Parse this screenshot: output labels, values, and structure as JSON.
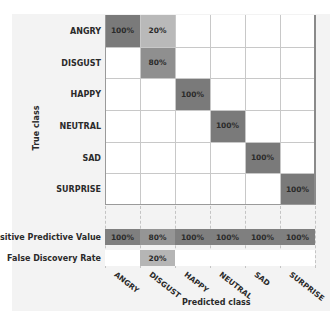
{
  "chart_data": {
    "type": "heatmap",
    "title": "",
    "xlabel": "Predicted class",
    "ylabel": "True class",
    "classes": [
      "ANGRY",
      "DISGUST",
      "HAPPY",
      "NEUTRAL",
      "SAD",
      "SURPRISE"
    ],
    "matrix": [
      [
        "100%",
        "20%",
        "",
        "",
        "",
        ""
      ],
      [
        "",
        "80%",
        "",
        "",
        "",
        ""
      ],
      [
        "",
        "",
        "100%",
        "",
        "",
        ""
      ],
      [
        "",
        "",
        "",
        "100%",
        "",
        ""
      ],
      [
        "",
        "",
        "",
        "",
        "100%",
        ""
      ],
      [
        "",
        "",
        "",
        "",
        "",
        "100%"
      ]
    ],
    "matrix_values": [
      [
        100,
        20,
        0,
        0,
        0,
        0
      ],
      [
        0,
        80,
        0,
        0,
        0,
        0
      ],
      [
        0,
        0,
        100,
        0,
        0,
        0
      ],
      [
        0,
        0,
        0,
        100,
        0,
        0
      ],
      [
        0,
        0,
        0,
        0,
        100,
        0
      ],
      [
        0,
        0,
        0,
        0,
        0,
        100
      ]
    ],
    "summary_rows": [
      {
        "label": "Positive Predictive Value",
        "values": [
          "100%",
          "80%",
          "100%",
          "100%",
          "100%",
          "100%"
        ]
      },
      {
        "label": "False Discovery Rate",
        "values": [
          "",
          "20%",
          "",
          "",
          "",
          ""
        ]
      }
    ],
    "colors": {
      "cell_100": "#7a7a7a",
      "cell_80": "#8f8f8f",
      "cell_20": "#b9b9b9",
      "ppv_100": "#7f7f7f",
      "ppv_80": "#959595",
      "fdr_20": "#b5b5b5",
      "empty": "#ffffff",
      "panel_bg": "#f3f3f3"
    }
  }
}
